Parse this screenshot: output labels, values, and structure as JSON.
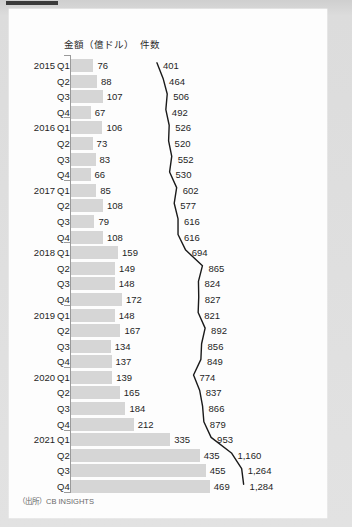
{
  "figure": {
    "source_note": "（出所）CB INSIGHTS",
    "faint_header": "",
    "amount_header": "金額（億ドル）",
    "count_header": "件数",
    "bar_color": "#d6d6d6",
    "line_color": "#1a1a1a",
    "axis_color": "#9a9a9a",
    "text_color": "#1f1f1f"
  },
  "chart_data": {
    "type": "bar",
    "title": "",
    "subtitle": "",
    "xlabel": "",
    "ylabel": "",
    "orientation": "horizontal",
    "grid": false,
    "legend_position": "top",
    "categories": [
      "2015 Q1",
      "2015 Q2",
      "2015 Q3",
      "2015 Q4",
      "2016 Q1",
      "2016 Q2",
      "2016 Q3",
      "2016 Q4",
      "2017 Q1",
      "2017 Q2",
      "2017 Q3",
      "2017 Q4",
      "2018 Q1",
      "2018 Q2",
      "2018 Q3",
      "2018 Q4",
      "2019 Q1",
      "2019 Q2",
      "2019 Q3",
      "2019 Q4",
      "2020 Q1",
      "2020 Q2",
      "2020 Q3",
      "2020 Q4",
      "2021 Q1",
      "2021 Q2",
      "2021 Q3",
      "2021 Q4"
    ],
    "years": [
      "2015",
      "",
      "",
      "",
      "2016",
      "",
      "",
      "",
      "2017",
      "",
      "",
      "",
      "2018",
      "",
      "",
      "",
      "2019",
      "",
      "",
      "",
      "2020",
      "",
      "",
      "",
      "2021",
      "",
      "",
      ""
    ],
    "quarters": [
      "Q1",
      "Q2",
      "Q3",
      "Q4",
      "Q1",
      "Q2",
      "Q3",
      "Q4",
      "Q1",
      "Q2",
      "Q3",
      "Q4",
      "Q1",
      "Q2",
      "Q3",
      "Q4",
      "Q1",
      "Q2",
      "Q3",
      "Q4",
      "Q1",
      "Q2",
      "Q3",
      "Q4",
      "Q1",
      "Q2",
      "Q3",
      "Q4"
    ],
    "series": [
      {
        "name": "金額（億ドル）",
        "type": "bar",
        "values": [
          76,
          88,
          107,
          67,
          106,
          73,
          83,
          66,
          85,
          108,
          79,
          108,
          159,
          149,
          148,
          172,
          148,
          167,
          134,
          137,
          139,
          165,
          184,
          212,
          335,
          435,
          455,
          469
        ],
        "labels": [
          "76",
          "88",
          "107",
          "67",
          "106",
          "73",
          "83",
          "66",
          "85",
          "108",
          "79",
          "108",
          "159",
          "149",
          "148",
          "172",
          "148",
          "167",
          "134",
          "137",
          "139",
          "165",
          "184",
          "212",
          "335",
          "435",
          "455",
          "469"
        ],
        "xlim": [
          0,
          500
        ]
      },
      {
        "name": "件数",
        "type": "line",
        "values": [
          401,
          464,
          506,
          492,
          526,
          520,
          552,
          530,
          602,
          577,
          616,
          616,
          694,
          865,
          824,
          827,
          821,
          892,
          856,
          849,
          774,
          837,
          866,
          879,
          953,
          1160,
          1264,
          1284
        ],
        "labels": [
          "401",
          "464",
          "506",
          "492",
          "526",
          "520",
          "552",
          "530",
          "602",
          "577",
          "616",
          "616",
          "694",
          "865",
          "824",
          "827",
          "821",
          "892",
          "856",
          "849",
          "774",
          "837",
          "866",
          "879",
          "953",
          "1,160",
          "1,264",
          "1,284"
        ],
        "xlim": [
          300,
          1400
        ]
      }
    ]
  }
}
